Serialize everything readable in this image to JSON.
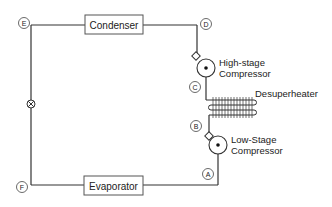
{
  "diagram": {
    "type": "two-stage refrigeration cycle schematic",
    "components": {
      "condenser": "Condenser",
      "evaporator": "Evaporator",
      "high_stage_compressor": [
        "High-stage",
        "Compressor"
      ],
      "low_stage_compressor": [
        "Low-Stage",
        "Compressor"
      ],
      "desuperheater": "Desuperheater",
      "expansion_valve": "expansion valve"
    },
    "state_points": {
      "A": "A",
      "B": "B",
      "C": "C",
      "D": "D",
      "E": "E",
      "F": "F"
    },
    "colors": {
      "line": "#333333",
      "background": "#ffffff"
    }
  }
}
